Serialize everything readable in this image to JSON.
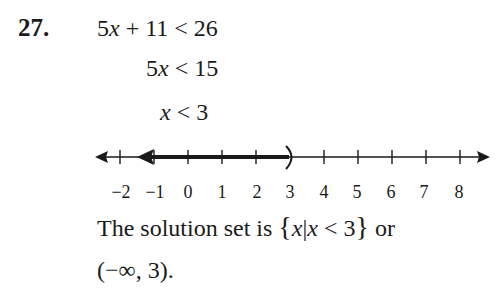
{
  "problem": {
    "number": "27.",
    "steps": [
      {
        "lhs_coef": "5",
        "var": "x",
        "rest": " + 11 < 26"
      },
      {
        "lhs_coef": "5",
        "var": "x",
        "rest": " < 15"
      },
      {
        "lhs_coef": "",
        "var": "x",
        "rest": " < 3"
      }
    ]
  },
  "number_line": {
    "ticks": [
      "−2",
      "−1",
      "0",
      "1",
      "2",
      "3",
      "4",
      "5",
      "6",
      "7",
      "8"
    ],
    "tick_values": [
      -2,
      -1,
      0,
      1,
      2,
      3,
      4,
      5,
      6,
      7,
      8
    ],
    "shaded_direction": "left",
    "endpoint": 3,
    "endpoint_type": "open-parenthesis"
  },
  "solution": {
    "sentence_prefix": "The solution set is ",
    "set_open": "{",
    "set_var": "x",
    "set_bar": "|",
    "set_cond_var": "x",
    "set_cond_rest": " < 3",
    "set_close": "}",
    "connector": " or",
    "interval": "(−∞, 3)."
  }
}
